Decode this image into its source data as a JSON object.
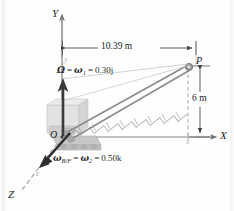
{
  "figure": {
    "background_color": "#fefefe",
    "axes": {
      "fixed": {
        "x_label": "X",
        "y_label": "Y",
        "z_label": "Z"
      },
      "rotating": {
        "x_label": "x",
        "y_label": "y",
        "z_label": "z"
      }
    },
    "points": {
      "origin_label": "O",
      "tip_label": "P"
    },
    "dimensions": [
      {
        "name": "horizontal-reach",
        "value": "10.39 m"
      },
      {
        "name": "vertical-height",
        "value": "6 m"
      }
    ],
    "vectors": [
      {
        "name": "omega-1",
        "symbol": "Ω",
        "equals": "=",
        "omega": "ω",
        "subscript": "1",
        "value": "0.30j",
        "full_text": "Ω = ω₁ = 0.30j",
        "direction": "up",
        "color": "#3b3b3b"
      },
      {
        "name": "omega-2",
        "symbol": "ω",
        "subscript_1": "B/F",
        "equals": "=",
        "omega": "ω",
        "subscript_2": "2",
        "value": "0.50k",
        "full_text": "ωB/F = ω₂ = 0.50k",
        "direction": "down-left",
        "color": "#2d2d2d"
      }
    ],
    "colors": {
      "line": "#6f6f6f",
      "dashed": "#9a9a9a",
      "boom": "#8c8c8c",
      "body": "#c9c9c9",
      "arrow_dark": "#333333",
      "text": "#222222"
    }
  }
}
